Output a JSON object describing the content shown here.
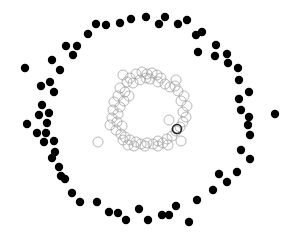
{
  "chart_data": {
    "type": "scatter",
    "title": "",
    "xlabel": "",
    "ylabel": "",
    "grid": false,
    "axes_visible": false,
    "legend": null,
    "coordinate_system": "pixel (x right, y down), canvas 289x240",
    "series": [
      {
        "name": "outer-ring",
        "marker": "filled-circle",
        "color": "#000000",
        "radius": 4.2,
        "points": [
          [
            25,
            68
          ],
          [
            52,
            60
          ],
          [
            60,
            70
          ],
          [
            66,
            46
          ],
          [
            77,
            46
          ],
          [
            73,
            55
          ],
          [
            88,
            34
          ],
          [
            96,
            24
          ],
          [
            106,
            25
          ],
          [
            120,
            23
          ],
          [
            131,
            19
          ],
          [
            146,
            17
          ],
          [
            159,
            24
          ],
          [
            165,
            17
          ],
          [
            178,
            24
          ],
          [
            187,
            20
          ],
          [
            196,
            35
          ],
          [
            202,
            32
          ],
          [
            198,
            52
          ],
          [
            216,
            45
          ],
          [
            215,
            56
          ],
          [
            227,
            54
          ],
          [
            228,
            63
          ],
          [
            238,
            68
          ],
          [
            239,
            80
          ],
          [
            249,
            92
          ],
          [
            239,
            99
          ],
          [
            241,
            110
          ],
          [
            249,
            117
          ],
          [
            275,
            114
          ],
          [
            41,
            86
          ],
          [
            50,
            82
          ],
          [
            54,
            92
          ],
          [
            42,
            105
          ],
          [
            39,
            115
          ],
          [
            49,
            113
          ],
          [
            27,
            124
          ],
          [
            47,
            123
          ],
          [
            37,
            133
          ],
          [
            46,
            133
          ],
          [
            44,
            142
          ],
          [
            54,
            141
          ],
          [
            55,
            152
          ],
          [
            52,
            158
          ],
          [
            59,
            167
          ],
          [
            61,
            176
          ],
          [
            65,
            179
          ],
          [
            248,
            125
          ],
          [
            250,
            135
          ],
          [
            241,
            150
          ],
          [
            250,
            159
          ],
          [
            219,
            174
          ],
          [
            237,
            172
          ],
          [
            227,
            182
          ],
          [
            213,
            190
          ],
          [
            72,
            193
          ],
          [
            80,
            202
          ],
          [
            97,
            202
          ],
          [
            109,
            212
          ],
          [
            118,
            213
          ],
          [
            126,
            220
          ],
          [
            139,
            209
          ],
          [
            148,
            220
          ],
          [
            162,
            215
          ],
          [
            169,
            215
          ],
          [
            176,
            206
          ],
          [
            189,
            222
          ],
          [
            197,
            200
          ]
        ]
      },
      {
        "name": "inner-ring",
        "marker": "hollow-circle",
        "color": "#9a9a9a",
        "radius": 5,
        "points": [
          [
            123,
            75
          ],
          [
            130,
            78
          ],
          [
            136,
            74
          ],
          [
            142,
            72
          ],
          [
            147,
            74
          ],
          [
            152,
            73
          ],
          [
            157,
            75
          ],
          [
            161,
            78
          ],
          [
            127,
            82
          ],
          [
            133,
            83
          ],
          [
            140,
            80
          ],
          [
            146,
            78
          ],
          [
            150,
            79
          ],
          [
            158,
            82
          ],
          [
            165,
            84
          ],
          [
            170,
            87
          ],
          [
            120,
            88
          ],
          [
            125,
            92
          ],
          [
            129,
            96
          ],
          [
            118,
            96
          ],
          [
            124,
            101
          ],
          [
            114,
            102
          ],
          [
            120,
            107
          ],
          [
            113,
            110
          ],
          [
            118,
            114
          ],
          [
            112,
            118
          ],
          [
            117,
            122
          ],
          [
            122,
            126
          ],
          [
            116,
            130
          ],
          [
            121,
            134
          ],
          [
            125,
            137
          ],
          [
            130,
            140
          ],
          [
            136,
            142
          ],
          [
            141,
            144
          ],
          [
            147,
            143
          ],
          [
            153,
            144
          ],
          [
            158,
            141
          ],
          [
            163,
            143
          ],
          [
            167,
            139
          ],
          [
            172,
            136
          ],
          [
            176,
            131
          ],
          [
            180,
            127
          ],
          [
            183,
            122
          ],
          [
            186,
            117
          ],
          [
            183,
            112
          ],
          [
            187,
            106
          ],
          [
            181,
            101
          ],
          [
            184,
            96
          ],
          [
            178,
            91
          ],
          [
            175,
            86
          ],
          [
            176,
            80
          ],
          [
            128,
            145
          ],
          [
            134,
            146
          ],
          [
            145,
            146
          ],
          [
            158,
            146
          ],
          [
            168,
            145
          ],
          [
            123,
            140
          ],
          [
            110,
            125
          ],
          [
            181,
            141
          ],
          [
            169,
            120
          ],
          [
            98,
            142
          ]
        ]
      },
      {
        "name": "highlighted",
        "marker": "hollow-circle",
        "color": "#222222",
        "radius": 4.5,
        "stroke_width": 1.6,
        "points": [
          [
            177,
            129
          ]
        ]
      }
    ]
  }
}
